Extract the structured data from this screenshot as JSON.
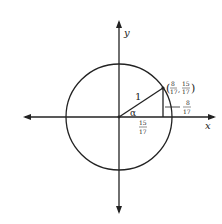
{
  "diagram": {
    "type": "unit-circle",
    "axis_labels": {
      "x": "x",
      "y": "y"
    },
    "radius_label": "1",
    "angle_label": "α",
    "point": {
      "x_num": "8",
      "x_den": "17",
      "y_num": "15",
      "y_den": "17"
    },
    "horizontal_leg": {
      "num": "15",
      "den": "17"
    },
    "vertical_leg": {
      "num": "8",
      "den": "17"
    },
    "colors": {
      "stroke": "#222222",
      "background": "#ffffff"
    }
  }
}
